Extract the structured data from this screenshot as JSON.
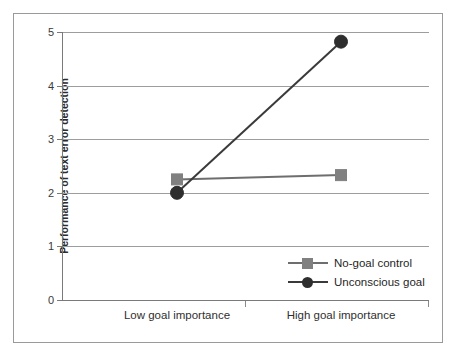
{
  "chart_data": {
    "type": "line",
    "title": "",
    "xlabel": "",
    "ylabel": "Performance of text error detection",
    "categories": [
      "Low goal importance",
      "High goal importance"
    ],
    "ylim": [
      0,
      5
    ],
    "yticks": [
      0,
      1,
      2,
      3,
      4,
      5
    ],
    "ytick_labels": [
      "0",
      "1",
      "2",
      "3",
      "4",
      "5"
    ],
    "grid": true,
    "legend_position": "inside-lower-right",
    "series": [
      {
        "name": "No-goal control",
        "values": [
          2.25,
          2.33
        ],
        "marker": "square",
        "color": "#808080",
        "line_color": "#6e6e6e"
      },
      {
        "name": "Unconscious goal",
        "values": [
          2.0,
          4.82
        ],
        "marker": "circle",
        "color": "#2e2e2e",
        "line_color": "#3a3a3a"
      }
    ]
  },
  "axes": {
    "y_title": "Performance of text error detection",
    "y_tick_labels": [
      "5",
      "4",
      "3",
      "2",
      "1",
      "0"
    ],
    "x_tick_labels": [
      "Low goal importance",
      "High goal importance"
    ]
  },
  "legend": {
    "items": [
      {
        "label": "No-goal control",
        "marker": "square-marker-icon"
      },
      {
        "label": "Unconscious goal",
        "marker": "circle-marker-icon"
      }
    ]
  },
  "colors": {
    "frame": "#9a9a9a",
    "gridline": "#9d9d9d",
    "axis": "#7a7a7a",
    "series_control": "#808080",
    "series_goal": "#2e2e2e",
    "text": "#2b2b2b",
    "background": "#ffffff"
  }
}
